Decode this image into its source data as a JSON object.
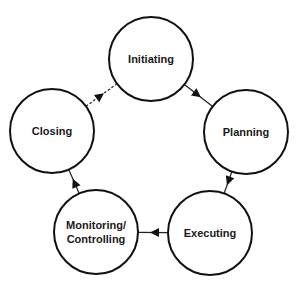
{
  "diagram": {
    "type": "cycle",
    "nodes": [
      {
        "id": "initiating",
        "label": [
          "Initiating"
        ]
      },
      {
        "id": "planning",
        "label": [
          "Planning"
        ]
      },
      {
        "id": "executing",
        "label": [
          "Executing"
        ]
      },
      {
        "id": "monitoring",
        "label": [
          "Monitoring/",
          "Controlling"
        ]
      },
      {
        "id": "closing",
        "label": [
          "Closing"
        ]
      }
    ],
    "edges": [
      {
        "from": "initiating",
        "to": "planning",
        "style": "solid"
      },
      {
        "from": "planning",
        "to": "executing",
        "style": "solid"
      },
      {
        "from": "executing",
        "to": "monitoring",
        "style": "solid"
      },
      {
        "from": "monitoring",
        "to": "closing",
        "style": "solid"
      },
      {
        "from": "closing",
        "to": "initiating",
        "style": "dashed"
      }
    ],
    "colors": {
      "stroke": "#111111",
      "fill": "#ffffff",
      "text": "#1a1a1a"
    }
  }
}
